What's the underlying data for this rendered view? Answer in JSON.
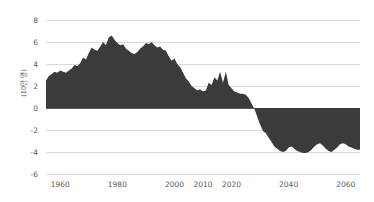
{
  "chart_data": {
    "type": "area",
    "title": "",
    "subtitle": "",
    "xlabel": "",
    "ylabel": "(10만 명)",
    "ylabel_full": "(10만 명)",
    "xlim": [
      1955,
      2065
    ],
    "ylim": [
      -6,
      8
    ],
    "grid": true,
    "legend": false,
    "legend_position": "none",
    "series_name": "자연증가 인구",
    "fill_color": "#3b3b3b",
    "gridline_color": "#d9d9d9",
    "zeroline_color": "#595959",
    "tick_color": "#595959",
    "y_ticks": [
      8,
      6,
      4,
      2,
      0,
      -2,
      -4,
      -6
    ],
    "y_tick_labels": [
      "8",
      "6",
      "4",
      "2",
      "0",
      "-2",
      "-4",
      "-6"
    ],
    "x_ticks": [
      1960,
      1980,
      2000,
      2010,
      2020,
      2040,
      2060
    ],
    "x_tick_labels": [
      "1960",
      "1980",
      "2000",
      "2010",
      "2020",
      "2040",
      "2060"
    ],
    "x": [
      1955,
      1956,
      1957,
      1958,
      1959,
      1960,
      1961,
      1962,
      1963,
      1964,
      1965,
      1966,
      1967,
      1968,
      1969,
      1970,
      1971,
      1972,
      1973,
      1974,
      1975,
      1976,
      1977,
      1978,
      1979,
      1980,
      1981,
      1982,
      1983,
      1984,
      1985,
      1986,
      1987,
      1988,
      1989,
      1990,
      1991,
      1992,
      1993,
      1994,
      1995,
      1996,
      1997,
      1998,
      1999,
      2000,
      2001,
      2002,
      2003,
      2004,
      2005,
      2006,
      2007,
      2008,
      2009,
      2010,
      2011,
      2012,
      2013,
      2014,
      2015,
      2016,
      2017,
      2018,
      2019,
      2020,
      2021,
      2022,
      2023,
      2024,
      2025,
      2026,
      2027,
      2028,
      2029,
      2030,
      2031,
      2032,
      2033,
      2034,
      2035,
      2036,
      2037,
      2038,
      2039,
      2040,
      2041,
      2042,
      2043,
      2044,
      2045,
      2046,
      2047,
      2048,
      2049,
      2050,
      2051,
      2052,
      2053,
      2054,
      2055,
      2056,
      2057,
      2058,
      2059,
      2060,
      2061,
      2062,
      2063,
      2064,
      2065
    ],
    "values": [
      2.5,
      2.9,
      3.1,
      3.3,
      3.2,
      3.4,
      3.3,
      3.2,
      3.4,
      3.6,
      3.9,
      3.8,
      4.1,
      4.6,
      4.4,
      5.0,
      5.5,
      5.3,
      5.2,
      5.6,
      6.0,
      5.7,
      6.4,
      6.6,
      6.2,
      5.9,
      5.7,
      5.8,
      5.4,
      5.2,
      5.0,
      4.9,
      5.1,
      5.4,
      5.6,
      5.9,
      5.8,
      6.0,
      5.7,
      5.5,
      5.6,
      5.3,
      5.2,
      4.7,
      4.3,
      4.5,
      4.0,
      3.7,
      3.2,
      2.7,
      2.4,
      2.0,
      1.8,
      1.6,
      1.7,
      1.5,
      1.6,
      2.3,
      2.1,
      2.8,
      2.5,
      3.3,
      2.3,
      3.3,
      2.1,
      1.8,
      1.5,
      1.4,
      1.3,
      1.3,
      1.2,
      0.9,
      0.4,
      -0.1,
      -0.8,
      -1.5,
      -2.1,
      -2.3,
      -2.7,
      -3.1,
      -3.5,
      -3.7,
      -3.9,
      -4.0,
      -3.9,
      -3.6,
      -3.5,
      -3.7,
      -3.9,
      -4.0,
      -4.1,
      -4.1,
      -4.0,
      -3.8,
      -3.5,
      -3.3,
      -3.2,
      -3.4,
      -3.7,
      -3.9,
      -4.0,
      -3.8,
      -3.6,
      -3.3,
      -3.2,
      -3.3,
      -3.5,
      -3.6,
      -3.7,
      -3.8,
      -3.8
    ]
  }
}
